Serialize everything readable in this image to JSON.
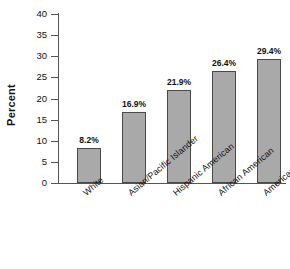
{
  "chart_data": {
    "type": "bar",
    "title": "",
    "subtitle": "",
    "xlabel": "",
    "ylabel": "Percent",
    "ylim": [
      0,
      40
    ],
    "ytick_step": 5,
    "yticks": [
      0,
      5,
      10,
      15,
      20,
      25,
      30,
      35,
      40
    ],
    "ytick_labels": [
      "0",
      "5",
      "10",
      "15",
      "20",
      "25",
      "30",
      "35",
      "40"
    ],
    "grid": false,
    "legend": null,
    "legend_position": "none",
    "categories": [
      "White",
      "Asian/Pacific Islander",
      "Hispanic American",
      "African American",
      "American Indian"
    ],
    "values": [
      8.2,
      16.9,
      21.9,
      26.4,
      29.4
    ],
    "data_labels": [
      "8.2%",
      "16.9%",
      "21.9%",
      "26.4%",
      "29.4%"
    ],
    "bar_fill_color": "#a9a9a9",
    "bar_edge_color": "#4a4a4a",
    "axis_color": "#555555",
    "background_color": "#ffffff",
    "x_label_rotation_deg": -40
  },
  "axis": {
    "y_title": "Percent"
  }
}
